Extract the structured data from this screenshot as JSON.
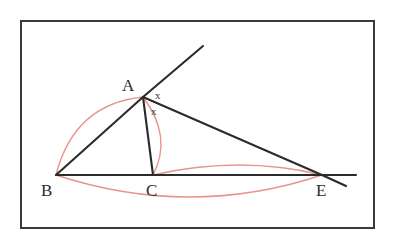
{
  "figure": {
    "kind": "geometry-diagram",
    "background_color": "#ffffff",
    "frame": {
      "name": "outer-border-rectangle",
      "stroke_color": "#3a3a3a",
      "stroke_width": 2,
      "x": 21,
      "y": 21,
      "width": 353,
      "height": 207
    },
    "ink_color": "#2b2b2b",
    "arc_color": "#e8948c",
    "points": [
      {
        "id": "A",
        "label": "A",
        "x": 143,
        "y": 97,
        "label_x": 122,
        "label_y": 91
      },
      {
        "id": "B",
        "label": "B",
        "x": 56,
        "y": 175,
        "label_x": 41,
        "label_y": 196
      },
      {
        "id": "C",
        "label": "C",
        "x": 153,
        "y": 175,
        "label_x": 146,
        "label_y": 196
      },
      {
        "id": "E",
        "label": "E",
        "x": 322,
        "y": 175,
        "label_x": 316,
        "label_y": 196
      }
    ],
    "segments": [
      {
        "id": "BA",
        "name": "segment-b-a",
        "x1": 56,
        "y1": 175,
        "x2": 143,
        "y2": 97
      },
      {
        "id": "A-ray",
        "name": "ray-b-a-extended",
        "x1": 143,
        "y1": 97,
        "x2": 203,
        "y2": 46
      },
      {
        "id": "AC",
        "name": "segment-a-c-bisector",
        "x1": 143,
        "y1": 97,
        "x2": 153,
        "y2": 175
      },
      {
        "id": "AE",
        "name": "segment-a-e",
        "x1": 143,
        "y1": 97,
        "x2": 322,
        "y2": 175
      },
      {
        "id": "AE-ext",
        "name": "segment-a-e-extended",
        "x1": 322,
        "y1": 175,
        "x2": 346,
        "y2": 186
      },
      {
        "id": "BE",
        "name": "segment-b-e-baseline",
        "x1": 56,
        "y1": 175,
        "x2": 322,
        "y2": 175
      },
      {
        "id": "BE-ext",
        "name": "baseline-extended-past-e",
        "x1": 322,
        "y1": 175,
        "x2": 356,
        "y2": 175
      }
    ],
    "arcs": [
      {
        "id": "arc-BA",
        "name": "red-arc-b-to-a",
        "d": "M 56 175 Q 74 104 143 97"
      },
      {
        "id": "arc-AC",
        "name": "red-arc-a-to-c",
        "d": "M 143 97 Q 173 137 153 175"
      },
      {
        "id": "arc-CE",
        "name": "red-arc-c-to-e",
        "d": "M 153 175 Q 240 155 322 175"
      },
      {
        "id": "arc-BE",
        "name": "red-arc-b-to-e",
        "d": "M 56 175 Q 190 219 322 175"
      }
    ],
    "angle_marks": [
      {
        "id": "x-upper",
        "name": "angle-mark-x-upper",
        "text": "x",
        "x": 155,
        "y": 99
      },
      {
        "id": "x-lower",
        "name": "angle-mark-x-lower",
        "text": "x",
        "x": 151,
        "y": 115
      }
    ]
  }
}
